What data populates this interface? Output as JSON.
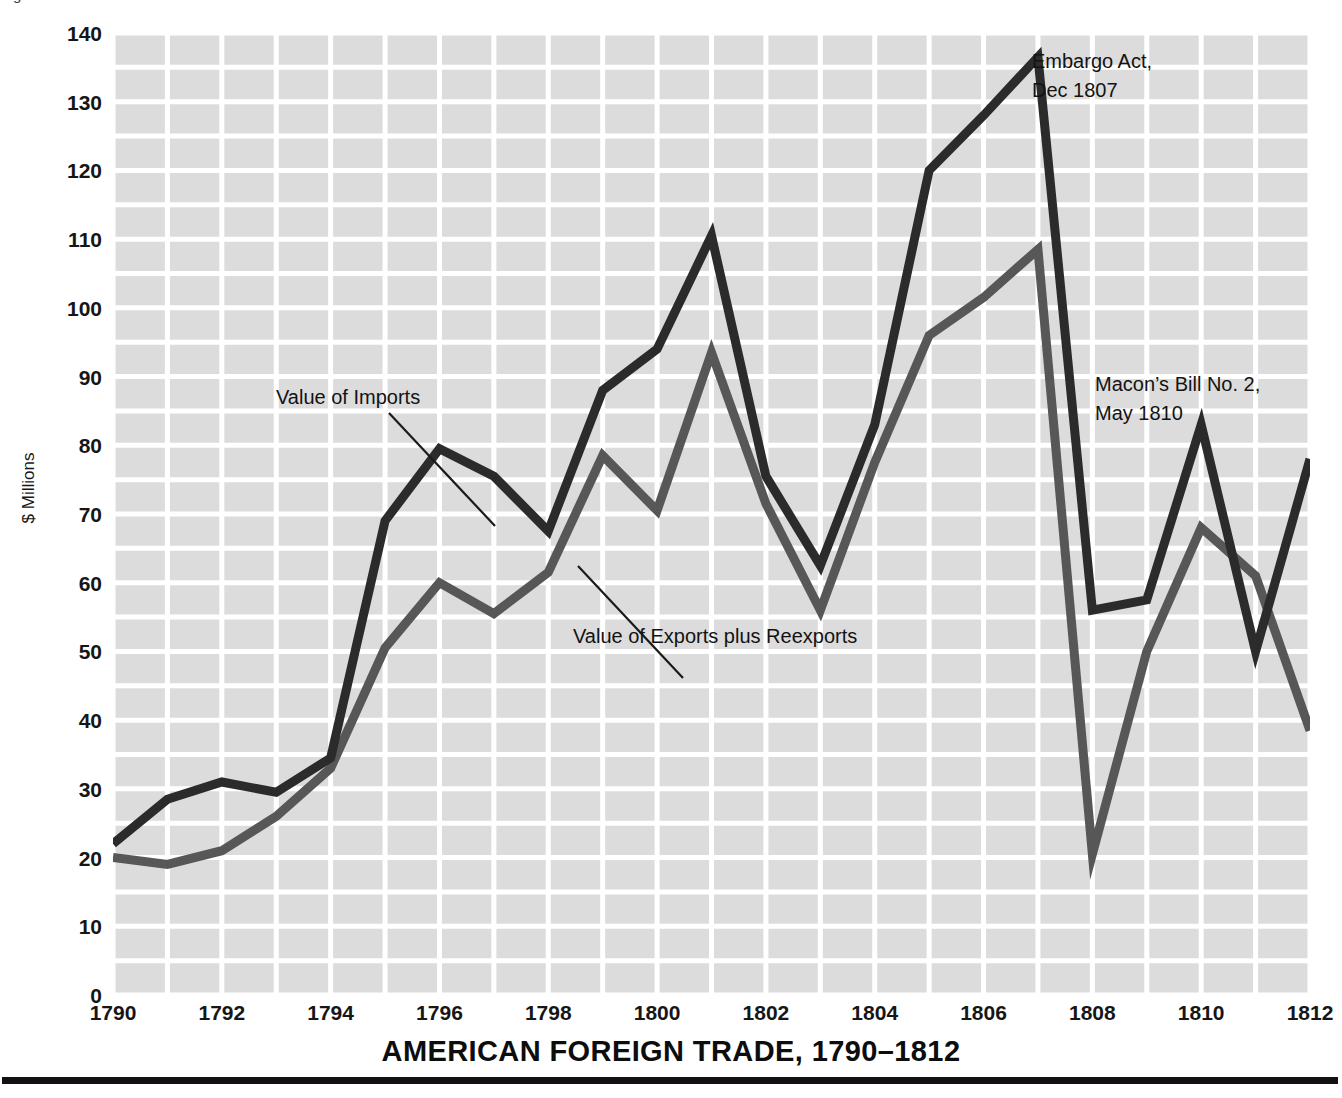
{
  "top_clipped_caption": "Figure",
  "chart_data": {
    "type": "line",
    "title": "AMERICAN FOREIGN TRADE, 1790–1812",
    "xlabel": "",
    "ylabel": "$ Millions",
    "xlim": [
      1790,
      1812
    ],
    "ylim": [
      0,
      140
    ],
    "grid": true,
    "grid_minor_step": 5,
    "legend_position": "inline-annotations",
    "x": [
      1790,
      1791,
      1792,
      1793,
      1794,
      1795,
      1796,
      1797,
      1798,
      1799,
      1800,
      1801,
      1802,
      1803,
      1804,
      1805,
      1806,
      1807,
      1808,
      1809,
      1810,
      1811,
      1812
    ],
    "xticks": [
      "1790",
      "1792",
      "1794",
      "1796",
      "1798",
      "1800",
      "1802",
      "1804",
      "1806",
      "1808",
      "1810",
      "1812"
    ],
    "yticks": [
      "0",
      "10",
      "20",
      "30",
      "40",
      "50",
      "60",
      "70",
      "80",
      "90",
      "100",
      "110",
      "120",
      "130",
      "140"
    ],
    "series": [
      {
        "name": "Value of Imports",
        "color": "#2b2b2b",
        "values": [
          22,
          28.5,
          31,
          29.5,
          34.5,
          69,
          79.5,
          75.5,
          67.5,
          88,
          94,
          110.5,
          75.5,
          62.5,
          83,
          120,
          128,
          136.5,
          56,
          57.5,
          83,
          50,
          78
        ]
      },
      {
        "name": "Value of Exports plus Reexports",
        "color": "#575757",
        "values": [
          20,
          19,
          21,
          26,
          33,
          50.5,
          60,
          55.5,
          61.5,
          78.5,
          70.5,
          93.5,
          71.5,
          56,
          77.5,
          96,
          101.5,
          108.5,
          20.5,
          50,
          68,
          61,
          38.5
        ]
      }
    ],
    "annotations": [
      {
        "id": "embargo",
        "text_line1": "Embargo Act,",
        "text_line2": "Dec 1807",
        "x": 1807,
        "y": 136.5
      },
      {
        "id": "macon",
        "text_line1": "Macon’s Bill No. 2,",
        "text_line2": "May 1810",
        "x": 1810,
        "y": 83
      },
      {
        "id": "imports",
        "text_line1": "Value of Imports",
        "text_line2": "",
        "x": 1795,
        "y": 69
      },
      {
        "id": "exports",
        "text_line1": "Value of Exports plus Reexports",
        "text_line2": "",
        "x": 1798,
        "y": 61.5
      }
    ],
    "colors": {
      "plot_background": "#dcdcdc",
      "gridline": "#ffffff",
      "imports_line": "#2b2b2b",
      "exports_line": "#575757",
      "text": "#111111",
      "rule": "#111111"
    }
  }
}
